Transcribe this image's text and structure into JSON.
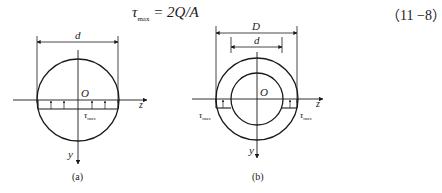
{
  "formula": {
    "symbol": "τ",
    "subscript": "max",
    "rhs": " = 2Q/A",
    "equation_number": "（11 −8）"
  },
  "figure_a": {
    "dimension_label": "d",
    "origin_label": "O",
    "axis_z_label": "z",
    "axis_y_label": "y",
    "stress_label": "τ",
    "stress_subscript": "max",
    "caption": "(a)"
  },
  "figure_b": {
    "outer_dimension_label": "D",
    "inner_dimension_label": "d",
    "origin_label": "O",
    "axis_z_label": "z",
    "axis_y_label": "y",
    "stress_label_left": "τ",
    "stress_label_right": "τ",
    "stress_subscript": "max",
    "caption": "(b)"
  }
}
